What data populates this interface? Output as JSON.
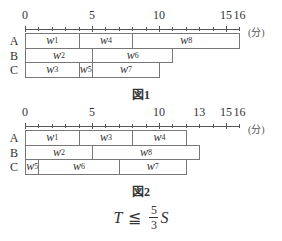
{
  "unit_label": "(分)",
  "figures": [
    {
      "caption": "図1",
      "tick_labels": [
        {
          "v": 0,
          "t": "0"
        },
        {
          "v": 5,
          "t": "5"
        },
        {
          "v": 10,
          "t": "10"
        },
        {
          "v": 15,
          "t": "15"
        },
        {
          "v": 16,
          "t": "16"
        }
      ],
      "rows": [
        {
          "label": "A",
          "tasks": [
            {
              "name": "w",
              "sub": "1",
              "start": 0,
              "end": 4
            },
            {
              "name": "w",
              "sub": "4",
              "start": 4,
              "end": 8
            },
            {
              "name": "w",
              "sub": "8",
              "start": 8,
              "end": 16
            }
          ]
        },
        {
          "label": "B",
          "tasks": [
            {
              "name": "w",
              "sub": "2",
              "start": 0,
              "end": 5
            },
            {
              "name": "w",
              "sub": "6",
              "start": 5,
              "end": 11
            }
          ]
        },
        {
          "label": "C",
          "tasks": [
            {
              "name": "w",
              "sub": "3",
              "start": 0,
              "end": 4
            },
            {
              "name": "w",
              "sub": "5",
              "start": 4,
              "end": 5
            },
            {
              "name": "w",
              "sub": "7",
              "start": 5,
              "end": 10
            }
          ]
        }
      ]
    },
    {
      "caption": "図2",
      "tick_labels": [
        {
          "v": 0,
          "t": "0"
        },
        {
          "v": 5,
          "t": "5"
        },
        {
          "v": 10,
          "t": "10"
        },
        {
          "v": 13,
          "t": "13"
        },
        {
          "v": 15,
          "t": "15"
        },
        {
          "v": 16,
          "t": "16"
        }
      ],
      "rows": [
        {
          "label": "A",
          "tasks": [
            {
              "name": "w",
              "sub": "1",
              "start": 0,
              "end": 4
            },
            {
              "name": "w",
              "sub": "3",
              "start": 4,
              "end": 8
            },
            {
              "name": "w",
              "sub": "4",
              "start": 8,
              "end": 12
            }
          ]
        },
        {
          "label": "B",
          "tasks": [
            {
              "name": "w",
              "sub": "2",
              "start": 0,
              "end": 5
            },
            {
              "name": "w",
              "sub": "8",
              "start": 5,
              "end": 13
            }
          ]
        },
        {
          "label": "C",
          "tasks": [
            {
              "name": "w",
              "sub": "5",
              "start": 0,
              "end": 1
            },
            {
              "name": "w",
              "sub": "6",
              "start": 1,
              "end": 7
            },
            {
              "name": "w",
              "sub": "7",
              "start": 7,
              "end": 12
            }
          ]
        }
      ]
    }
  ],
  "formula": {
    "lhs": "T",
    "op": "≦",
    "num": "5",
    "den": "3",
    "rhs": "S"
  }
}
